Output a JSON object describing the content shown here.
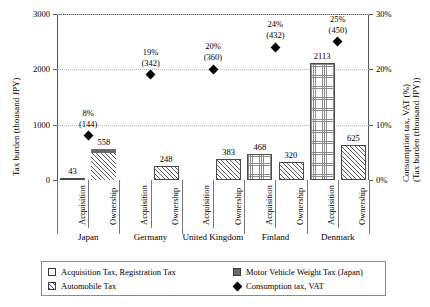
{
  "chart_data": {
    "type": "bar",
    "title": "",
    "subtitle": "",
    "categories": [
      "Japan",
      "Germany",
      "United Kingdom",
      "Finland",
      "Denmark"
    ],
    "subcategories": [
      "Acquisition",
      "Ownership"
    ],
    "ylabel": "Tax burden (thousand JPY)",
    "ylabel_right_1": "Consumption tax, VAT (%)",
    "ylabel_right_2": "(Tax burden (thousand JPY))",
    "xlabel": "",
    "ylim": [
      0,
      3000
    ],
    "ylim_right": [
      0,
      30
    ],
    "yticks": [
      "0",
      "1000",
      "2000",
      "3000"
    ],
    "ytick_values": [
      0,
      1000,
      2000,
      3000
    ],
    "yticks_right": [
      "0%",
      "10%",
      "20%",
      "30%"
    ],
    "ytick_values_right": [
      0,
      10,
      20,
      30
    ],
    "grid": true,
    "legend_position": "bottom",
    "series": [
      {
        "name": "Acquisition Tax, Registration Tax",
        "pattern": "plain",
        "values": [
          43,
          0,
          0,
          0,
          0
        ]
      },
      {
        "name": "Automobile Tax",
        "pattern": "diagonal-hatch",
        "values": [
          505,
          248,
          383,
          320,
          625
        ]
      },
      {
        "name": "Motor Vehicle Weight Tax (Japan)",
        "pattern": "dark-solid",
        "values": [
          53,
          0,
          0,
          0,
          0
        ]
      },
      {
        "name": "Acquisition (grid pattern)",
        "pattern": "fine-grid",
        "values": [
          0,
          0,
          0,
          468,
          2113
        ]
      }
    ],
    "bars": [
      {
        "country": "Japan",
        "group": "Acquisition",
        "total": 43,
        "label": "43",
        "pattern": "plain"
      },
      {
        "country": "Japan",
        "group": "Ownership",
        "total": 558,
        "label": "558",
        "pattern": "diagonal-hatch+dark-top"
      },
      {
        "country": "Germany",
        "group": "Acquisition",
        "total": 0,
        "label": "",
        "pattern": "none"
      },
      {
        "country": "Germany",
        "group": "Ownership",
        "total": 248,
        "label": "248",
        "pattern": "diagonal-hatch"
      },
      {
        "country": "United Kingdom",
        "group": "Acquisition",
        "total": 0,
        "label": "",
        "pattern": "none"
      },
      {
        "country": "United Kingdom",
        "group": "Ownership",
        "total": 383,
        "label": "383",
        "pattern": "diagonal-hatch"
      },
      {
        "country": "Finland",
        "group": "Acquisition",
        "total": 468,
        "label": "468",
        "pattern": "fine-grid"
      },
      {
        "country": "Finland",
        "group": "Ownership",
        "total": 320,
        "label": "320",
        "pattern": "diagonal-hatch"
      },
      {
        "country": "Denmark",
        "group": "Acquisition",
        "total": 2113,
        "label": "2113",
        "pattern": "fine-grid"
      },
      {
        "country": "Denmark",
        "group": "Ownership",
        "total": 625,
        "label": "625",
        "pattern": "diagonal-hatch"
      }
    ],
    "vat_series": {
      "name": "Consumption tax, VAT",
      "marker": "diamond",
      "points": [
        {
          "country": "Japan",
          "percent": 8,
          "percent_label": "8%",
          "amount": 144,
          "amount_label": "(144)"
        },
        {
          "country": "Germany",
          "percent": 19,
          "percent_label": "19%",
          "amount": 342,
          "amount_label": "(342)"
        },
        {
          "country": "United Kingdom",
          "percent": 20,
          "percent_label": "20%",
          "amount": 360,
          "amount_label": "(360)"
        },
        {
          "country": "Finland",
          "percent": 24,
          "percent_label": "24%",
          "amount": 432,
          "amount_label": "(432)"
        },
        {
          "country": "Denmark",
          "percent": 25,
          "percent_label": "25%",
          "amount": 450,
          "amount_label": "(450)"
        }
      ]
    },
    "legend": [
      {
        "label": "Acquisition Tax, Registration Tax",
        "swatch": "plain"
      },
      {
        "label": "Motor Vehicle Weight Tax (Japan)",
        "swatch": "dark-solid"
      },
      {
        "label": "Automobile Tax",
        "swatch": "diagonal-hatch"
      },
      {
        "label": "Consumption tax, VAT",
        "swatch": "diamond"
      }
    ],
    "colors": {
      "marker": "#000000",
      "dark_fill": "#6b6b6b",
      "hatch": "#5a5a5a",
      "grid": "#b9b9b9",
      "axis": "#555555",
      "bar_border": "#4a4a4a"
    }
  }
}
